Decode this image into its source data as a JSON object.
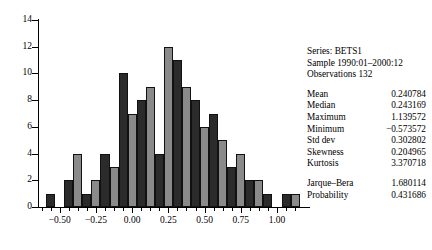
{
  "stats": {
    "series_line": "Series: BETS1",
    "sample_line": "Sample 1990:01–2000:12",
    "observations_line": "Observations 132",
    "rows": [
      {
        "label": "Mean",
        "value": "0.240784"
      },
      {
        "label": "Median",
        "value": "0.243169"
      },
      {
        "label": "Maximum",
        "value": "1.139572"
      },
      {
        "label": "Minimum",
        "value": "−0.573572"
      },
      {
        "label": "Std dev",
        "value": "0.302802"
      },
      {
        "label": "Skewness",
        "value": "0.204965"
      },
      {
        "label": "Kurtosis",
        "value": "3.370718"
      }
    ],
    "test_rows": [
      {
        "label": "Jarque–Bera",
        "value": "1.680114"
      },
      {
        "label": "Probability",
        "value": "0.431686"
      }
    ]
  },
  "chart_data": {
    "type": "bar",
    "title": "",
    "xlabel": "",
    "ylabel": "",
    "ylim": [
      0,
      14
    ],
    "xlim": [
      -0.65,
      1.2
    ],
    "grid": false,
    "legend": false,
    "y_ticks": [
      0,
      2,
      4,
      6,
      8,
      10,
      12,
      14
    ],
    "y_tick_labels": [
      "0",
      "2",
      "4",
      "6",
      "8",
      "10",
      "12",
      "14"
    ],
    "x_ticks": [
      -0.5,
      -0.25,
      0.0,
      0.25,
      0.5,
      0.75,
      1.0
    ],
    "x_tick_labels": [
      "−0.50",
      "−0.25",
      "0.00",
      "0.25",
      "0.50",
      "0.75",
      "1.00"
    ],
    "x_minor_ticks": [
      -0.625,
      -0.5625,
      -0.4375,
      -0.375,
      -0.3125,
      -0.1875,
      -0.125,
      -0.0625,
      0.0625,
      0.125,
      0.1875,
      0.3125,
      0.375,
      0.4375,
      0.5625,
      0.625,
      0.6875,
      0.8125,
      0.875,
      0.9375,
      1.0625,
      1.125
    ],
    "bar_colors": [
      "#2b2b2b",
      "#8a8a8a"
    ],
    "bin_width": 0.0625,
    "bin_centers": [
      -0.5625,
      -0.5,
      -0.4375,
      -0.375,
      -0.3125,
      -0.25,
      -0.1875,
      -0.125,
      -0.0625,
      0.0,
      0.0625,
      0.125,
      0.1875,
      0.25,
      0.3125,
      0.375,
      0.4375,
      0.5,
      0.5625,
      0.625,
      0.6875,
      0.75,
      0.8125,
      0.875,
      0.9375,
      1.0,
      1.0625,
      1.125
    ],
    "values": [
      1,
      0,
      2,
      4,
      1,
      2,
      4,
      3,
      10,
      7,
      8,
      9,
      4,
      12,
      11,
      9,
      8,
      6,
      7,
      5,
      3,
      4,
      2,
      2,
      1,
      0,
      1,
      1
    ]
  }
}
